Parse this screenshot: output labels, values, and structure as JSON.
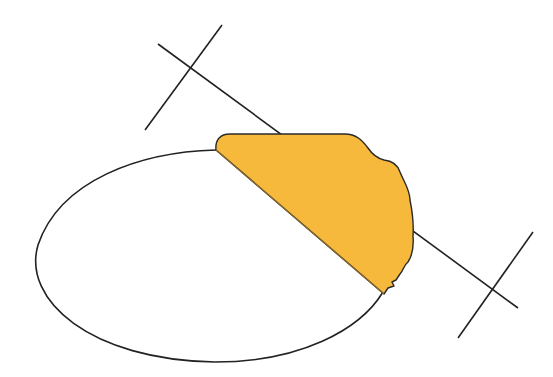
{
  "diagram": {
    "colors": {
      "background": "#ffffff",
      "stroke": "#222222",
      "fill": "#f6b93b",
      "fill_edge": "#8a6a2a"
    },
    "ellipse": {
      "cx": 222,
      "cy": 255,
      "rx": 190,
      "ry": 108
    },
    "cut_line": {
      "x1": 158,
      "y1": 44,
      "x2": 518,
      "y2": 308
    },
    "tick_marks": [
      {
        "x1": 222,
        "y1": 25,
        "x2": 145,
        "y2": 130
      },
      {
        "x1": 533,
        "y1": 232,
        "x2": 458,
        "y2": 338
      }
    ],
    "shaded_region": {
      "label": "",
      "shape": "irregular segment (piece broken off ellipse)"
    }
  }
}
